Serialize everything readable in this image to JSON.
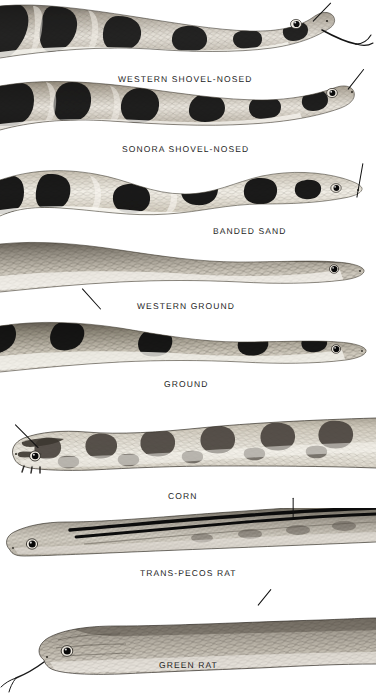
{
  "plate": {
    "title": "Snake head and body pattern plate",
    "background_color": "#ffffff",
    "ink_color": "#1c1c1c",
    "width": 376,
    "height": 693
  },
  "figures": [
    {
      "id": "western-shovel-nosed",
      "label": "WESTERN  SHOVEL-NOSED",
      "label_x": 118,
      "label_y": 74,
      "band_count": 5,
      "body_tone": "#b9b2a6",
      "band_tone": "#1a1a1a",
      "has_forked_tongue": true,
      "pointer": {
        "x1": 313,
        "y1": 21,
        "x2": 331,
        "y2": 2
      }
    },
    {
      "id": "sonora-shovel-nosed",
      "label": "SONORA  SHOVEL-NOSED",
      "label_x": 122,
      "label_y": 144,
      "band_count": 5,
      "body_tone": "#b5ada0",
      "band_tone": "#171717",
      "has_forked_tongue": false,
      "pointer": {
        "x1": 348,
        "y1": 89,
        "x2": 364,
        "y2": 68
      }
    },
    {
      "id": "banded-sand",
      "label": "BANDED  SAND",
      "label_x": 213,
      "label_y": 226,
      "band_count": 5,
      "body_tone": "#cfc9bd",
      "band_tone": "#121212",
      "has_forked_tongue": false,
      "pointer": {
        "x1": 357,
        "y1": 197,
        "x2": 363,
        "y2": 163
      }
    },
    {
      "id": "western-ground",
      "label": "WESTERN  GROUND",
      "label_x": 137,
      "label_y": 301,
      "band_count": 0,
      "body_tone": "#9c968b",
      "band_tone": "#1a1a1a",
      "has_forked_tongue": false,
      "pointer": {
        "x1": 82,
        "y1": 288,
        "x2": 101,
        "y2": 309
      }
    },
    {
      "id": "ground",
      "label": "GROUND",
      "label_x": 164,
      "label_y": 379,
      "band_count": 4,
      "body_tone": "#a49d92",
      "band_tone": "#111111",
      "has_forked_tongue": false,
      "pointer": null
    },
    {
      "id": "corn",
      "label": "CORN",
      "label_x": 168,
      "label_y": 491,
      "band_count": 8,
      "body_tone": "#b3aa9c",
      "band_tone": "#4b4540",
      "has_forked_tongue": false,
      "pointer": {
        "x1": 15,
        "y1": 424,
        "x2": 38,
        "y2": 447
      }
    },
    {
      "id": "trans-pecos-rat",
      "label": "TRANS-PECOS  RAT",
      "label_x": 140,
      "label_y": 568,
      "band_count": 0,
      "body_tone": "#a7a196",
      "band_tone": "#101010",
      "has_forked_tongue": false,
      "pointer": {
        "x1": 293,
        "y1": 497,
        "x2": 293,
        "y2": 516
      }
    },
    {
      "id": "green-rat",
      "label": "GREEN  RAT",
      "label_x": 159,
      "label_y": 660,
      "band_count": 0,
      "body_tone": "#9a948a",
      "band_tone": "#222222",
      "has_forked_tongue": true,
      "pointer": {
        "x1": 258,
        "y1": 605,
        "x2": 271,
        "y2": 589
      }
    }
  ]
}
